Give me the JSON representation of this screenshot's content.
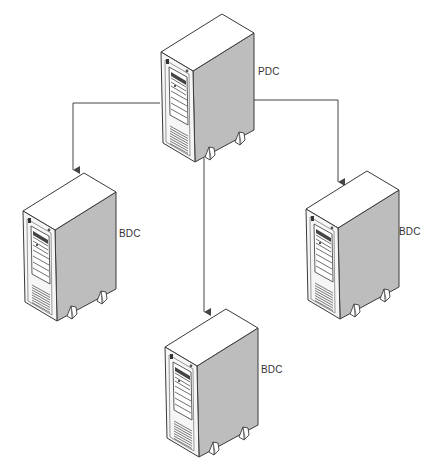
{
  "diagram": {
    "type": "domain-controller-replication",
    "colors": {
      "background": "#ffffff",
      "stroke": "#3a3a3a",
      "top_face": "#ffffff",
      "front_face": "#f4f4f4",
      "side_face": "#bdbdbd",
      "connector": "#444444"
    },
    "nodes": [
      {
        "id": "pdc",
        "label": "PDC",
        "icon": "server-tower-icon",
        "x": 161,
        "y": 14,
        "label_x": 258,
        "label_y": 66
      },
      {
        "id": "bdc-left",
        "label": "BDC",
        "icon": "server-tower-icon",
        "x": 23,
        "y": 173,
        "label_x": 119,
        "label_y": 228
      },
      {
        "id": "bdc-bottom",
        "label": "BDC",
        "icon": "server-tower-icon",
        "x": 165,
        "y": 309,
        "label_x": 261,
        "label_y": 364
      },
      {
        "id": "bdc-right",
        "label": "BDC",
        "icon": "server-tower-icon",
        "x": 306,
        "y": 171,
        "label_x": 399,
        "label_y": 226
      }
    ],
    "edges": [
      {
        "from": "pdc",
        "to": "bdc-left",
        "path": "M160,103 L73,103 L73,172"
      },
      {
        "from": "pdc",
        "to": "bdc-bottom",
        "path": "M204,158 L204,314"
      },
      {
        "from": "pdc",
        "to": "bdc-right",
        "path": "M254,100 L338,100 L338,184"
      }
    ]
  }
}
